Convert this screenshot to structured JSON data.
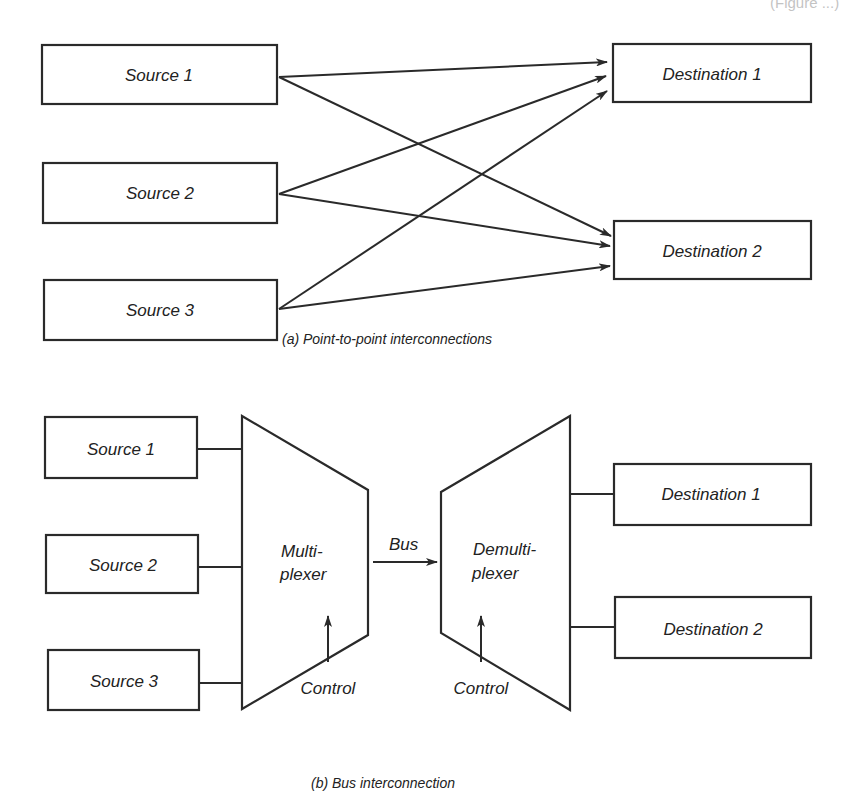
{
  "header_fragment": "(Figure ...)",
  "panel_a": {
    "caption": "(a)  Point-to-point interconnections",
    "sources": [
      {
        "label": "Source 1"
      },
      {
        "label": "Source 2"
      },
      {
        "label": "Source 3"
      }
    ],
    "destinations": [
      {
        "label": "Destination 1"
      },
      {
        "label": "Destination 2"
      }
    ],
    "connections": [
      {
        "from": "Source 1",
        "to": "Destination 1"
      },
      {
        "from": "Source 1",
        "to": "Destination 2"
      },
      {
        "from": "Source 2",
        "to": "Destination 1"
      },
      {
        "from": "Source 2",
        "to": "Destination 2"
      },
      {
        "from": "Source 3",
        "to": "Destination 1"
      },
      {
        "from": "Source 3",
        "to": "Destination 2"
      }
    ]
  },
  "panel_b": {
    "caption": "(b)  Bus interconnection",
    "sources": [
      {
        "label": "Source 1"
      },
      {
        "label": "Source 2"
      },
      {
        "label": "Source 3"
      }
    ],
    "multiplexer": {
      "line1": "Multi-",
      "line2": "plexer",
      "control": "Control"
    },
    "bus_label": "Bus",
    "demultiplexer": {
      "line1": "Demulti-",
      "line2": "plexer",
      "control": "Control"
    },
    "destinations": [
      {
        "label": "Destination 1"
      },
      {
        "label": "Destination 2"
      }
    ]
  },
  "colors": {
    "ink": "#2a2a2a",
    "background": "#ffffff"
  }
}
